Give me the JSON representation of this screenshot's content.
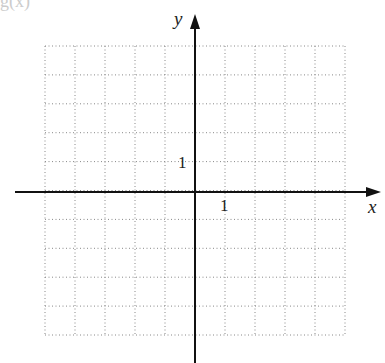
{
  "header": {
    "partial_text": "g(x)"
  },
  "chart_data": {
    "type": "grid",
    "title": "",
    "xlabel": "x",
    "ylabel": "y",
    "xlim": [
      -5,
      5
    ],
    "ylim": [
      -5,
      5
    ],
    "grid": true,
    "grid_style": "dotted",
    "x_tick_label": "1",
    "y_tick_label": "1",
    "series": []
  },
  "colors": {
    "axis": "#111111",
    "grid": "#888888"
  }
}
